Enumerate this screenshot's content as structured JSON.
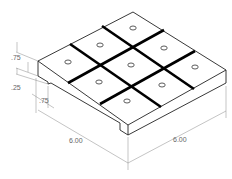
{
  "diagram": {
    "type": "isometric technical drawing",
    "grid": {
      "rows": 3,
      "cols": 3,
      "holes": 9
    },
    "dimensions": {
      "top_height": ".75",
      "step_height": ".25",
      "step_width": ".75",
      "length_left": "6.00",
      "length_right": "6.00"
    },
    "colors": {
      "line": "#111111",
      "groove": "#000000",
      "dimension": "#777777"
    }
  }
}
